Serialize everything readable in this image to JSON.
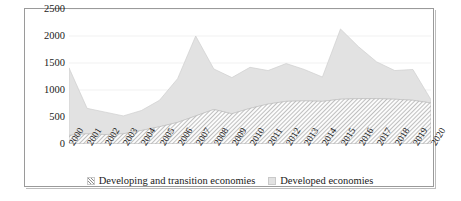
{
  "chart_data": {
    "type": "area",
    "stacked": true,
    "title": "",
    "xlabel": "",
    "ylabel": "",
    "ylim": [
      0,
      2500
    ],
    "ytick_values": [
      0,
      500,
      1000,
      1500,
      2000,
      2500
    ],
    "ytick_labels": [
      "0",
      "500",
      "1000",
      "1500",
      "2000",
      "2500"
    ],
    "grid": true,
    "grid_axis": "y",
    "legend_position": "bottom-center",
    "categories": [
      "2000",
      "2001",
      "2002",
      "2003",
      "2004",
      "2005",
      "2006",
      "2007",
      "2008",
      "2009",
      "2010",
      "2011",
      "2012",
      "2013",
      "2014",
      "2015",
      "2016",
      "2017",
      "2018",
      "2019",
      "2020"
    ],
    "series": [
      {
        "name": "Developing and transition economies",
        "pattern": "hatch",
        "color": "#fbfbfb",
        "values": [
          160,
          190,
          175,
          190,
          250,
          320,
          400,
          520,
          640,
          560,
          660,
          740,
          790,
          800,
          790,
          830,
          840,
          840,
          830,
          810,
          760
        ]
      },
      {
        "name": "Developed economies",
        "pattern": "solid",
        "color": "#e2e2e2",
        "values": [
          1250,
          470,
          415,
          330,
          370,
          490,
          810,
          1480,
          750,
          670,
          760,
          620,
          700,
          580,
          450,
          1300,
          960,
          680,
          530,
          570,
          60
        ]
      }
    ],
    "totals": [
      1410,
      660,
      590,
      520,
      620,
      810,
      1210,
      2000,
      1390,
      1230,
      1420,
      1360,
      1490,
      1380,
      1240,
      2130,
      1800,
      1520,
      1360,
      1380,
      820
    ]
  },
  "legend": {
    "entries": [
      {
        "label": "Developing and transition economies",
        "marker": "hatch-swatch"
      },
      {
        "label": "Developed economies",
        "marker": "solid-swatch"
      }
    ]
  }
}
